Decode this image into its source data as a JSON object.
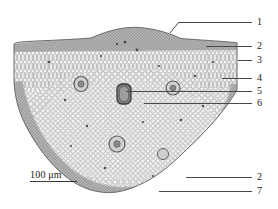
{
  "figure": {
    "kind": "light-micrograph",
    "scale_bar": {
      "label": "100 μm",
      "length_px": 47
    },
    "callouts": [
      {
        "id": "1",
        "label": "1",
        "label_x": 257,
        "label_y": 17,
        "side": "right",
        "line_x": 178,
        "line_y": 22,
        "line_w": 74,
        "kink": {
          "x1": 170,
          "y1": 33,
          "x2": 179,
          "y2": 22
        }
      },
      {
        "id": "2a",
        "label": "2",
        "label_x": 257,
        "label_y": 41,
        "side": "right",
        "line_x": 206,
        "line_y": 46,
        "line_w": 46,
        "kink": null
      },
      {
        "id": "3",
        "label": "3",
        "label_x": 257,
        "label_y": 55,
        "side": "right",
        "line_x": 238,
        "line_y": 60,
        "line_w": 14,
        "kink": null
      },
      {
        "id": "4",
        "label": "4",
        "label_x": 257,
        "label_y": 73,
        "side": "right",
        "line_x": 222,
        "line_y": 78,
        "line_w": 30,
        "kink": null
      },
      {
        "id": "5",
        "label": "5",
        "label_x": 257,
        "label_y": 86,
        "side": "right",
        "line_x": 126,
        "line_y": 91,
        "line_w": 126,
        "kink": null
      },
      {
        "id": "6",
        "label": "6",
        "label_x": 257,
        "label_y": 98,
        "side": "right",
        "line_x": 144,
        "line_y": 103,
        "line_w": 108,
        "kink": null
      },
      {
        "id": "2b",
        "label": "2",
        "label_x": 257,
        "label_y": 172,
        "side": "right",
        "line_x": 186,
        "line_y": 177,
        "line_w": 66,
        "kink": null
      },
      {
        "id": "7",
        "label": "7",
        "label_x": 257,
        "label_y": 186,
        "side": "right",
        "line_x": 159,
        "line_y": 191,
        "line_w": 93,
        "kink": null
      }
    ],
    "colors": {
      "tissue_light": "#e9e9e9",
      "tissue_mid": "#bdbdbd",
      "tissue_dark": "#6f6f6f",
      "leader": "#4a4a4a",
      "text": "#1a1a1a",
      "background": "#ffffff"
    }
  }
}
